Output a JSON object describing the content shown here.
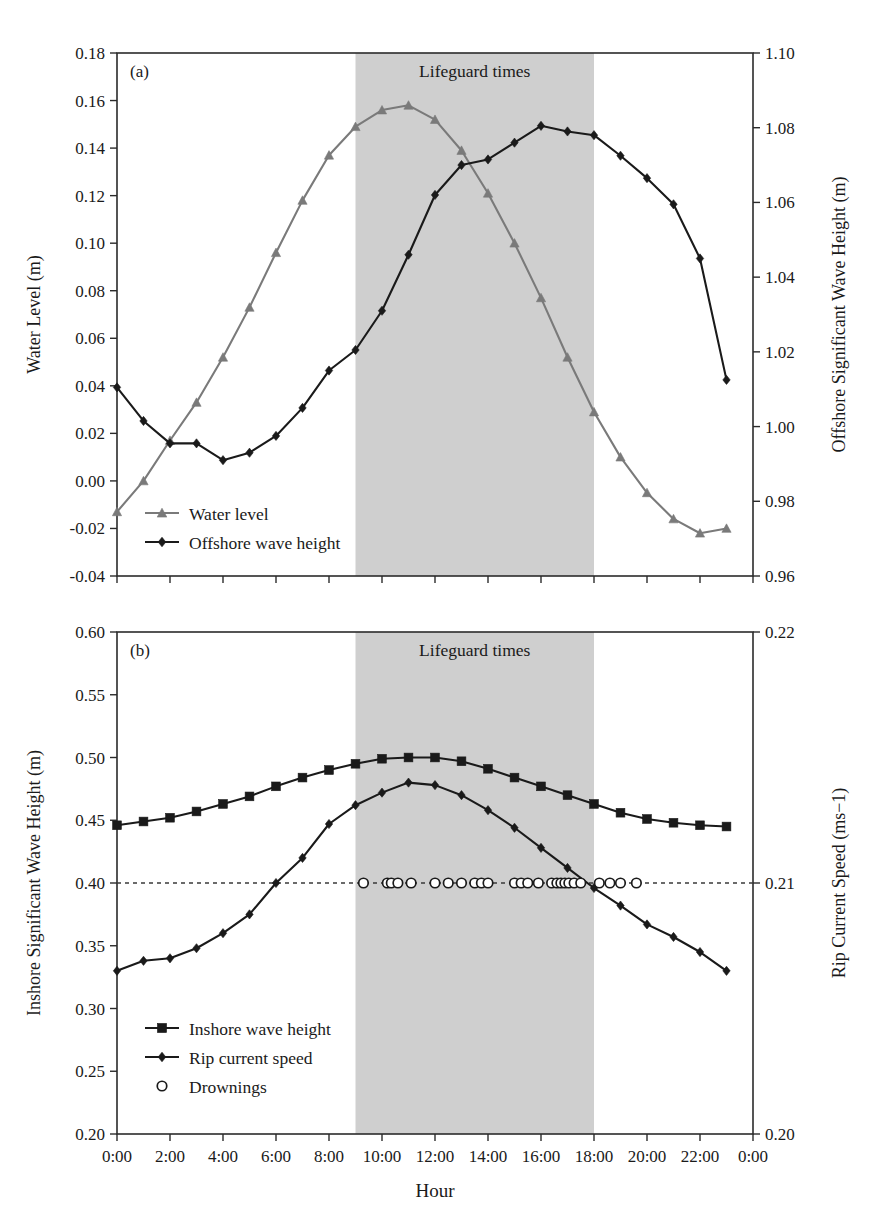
{
  "figure": {
    "width": 881,
    "height": 1224,
    "background": "#ffffff",
    "xlabel": "Hour",
    "band_label": "Lifeguard times",
    "panel_a_tag": "(a)",
    "panel_b_tag": "(b)"
  },
  "colors": {
    "water_level": "#7a7a7a",
    "offshore_wave": "#1a1a1a",
    "inshore_wave": "#1a1a1a",
    "rip_current": "#1a1a1a",
    "drownings": "#1a1a1a",
    "lifeguard_band": "#cfcfcf",
    "axis": "#2b2b2b",
    "dashed_line": "#3a3a3a"
  },
  "chart_data": [
    {
      "id": "panel_a",
      "type": "line",
      "title": "(a)",
      "xlabel": "Hour",
      "x": [
        "0:00",
        "1:00",
        "2:00",
        "3:00",
        "4:00",
        "5:00",
        "6:00",
        "7:00",
        "8:00",
        "9:00",
        "10:00",
        "11:00",
        "12:00",
        "13:00",
        "14:00",
        "15:00",
        "16:00",
        "17:00",
        "18:00",
        "19:00",
        "20:00",
        "21:00",
        "22:00",
        "23:00"
      ],
      "xticks": [
        "0:00",
        "2:00",
        "4:00",
        "6:00",
        "8:00",
        "10:00",
        "12:00",
        "14:00",
        "16:00",
        "18:00",
        "20:00",
        "22:00",
        "0:00"
      ],
      "xlim": [
        0,
        24
      ],
      "grid": false,
      "legend_position": "bottom-left",
      "left_axis": {
        "label": "Water Level (m)",
        "ylim": [
          -0.04,
          0.18
        ],
        "ticks": [
          -0.04,
          -0.02,
          0.0,
          0.02,
          0.04,
          0.06,
          0.08,
          0.1,
          0.12,
          0.14,
          0.16,
          0.18
        ],
        "ticklabels": [
          "-0.04",
          "-0.02",
          "0.00",
          "0.02",
          "0.04",
          "0.06",
          "0.08",
          "0.10",
          "0.12",
          "0.14",
          "0.16",
          "0.18"
        ]
      },
      "right_axis": {
        "label": "Offshore Significant Wave Height (m)",
        "ylim": [
          0.96,
          1.1
        ],
        "ticks": [
          0.96,
          0.98,
          1.0,
          1.02,
          1.04,
          1.06,
          1.08,
          1.1
        ],
        "ticklabels": [
          "0.96",
          "0.98",
          "1.00",
          "1.02",
          "1.04",
          "1.06",
          "1.08",
          "1.10"
        ]
      },
      "shaded_region": {
        "label": "Lifeguard times",
        "start": 9,
        "end": 18
      },
      "series": [
        {
          "name": "Water level",
          "axis": "left",
          "marker": "triangle",
          "color": "#7a7a7a",
          "values": [
            -0.013,
            0.0,
            0.017,
            0.033,
            0.052,
            0.073,
            0.096,
            0.118,
            0.137,
            0.149,
            0.156,
            0.158,
            0.152,
            0.139,
            0.121,
            0.1,
            0.077,
            0.052,
            0.029,
            0.01,
            -0.005,
            -0.016,
            -0.022,
            -0.02
          ]
        },
        {
          "name": "Offshore wave height",
          "axis": "right",
          "marker": "diamond",
          "color": "#1a1a1a",
          "values": [
            1.0105,
            1.0015,
            0.9955,
            0.9955,
            0.991,
            0.993,
            0.9975,
            1.005,
            1.015,
            1.0205,
            1.031,
            1.046,
            1.062,
            1.07,
            1.0715,
            1.076,
            1.0805,
            1.079,
            1.078,
            1.0725,
            1.0665,
            1.0595,
            1.045,
            1.0125
          ]
        }
      ]
    },
    {
      "id": "panel_b",
      "type": "line",
      "title": "(b)",
      "xlabel": "Hour",
      "x": [
        "0:00",
        "1:00",
        "2:00",
        "3:00",
        "4:00",
        "5:00",
        "6:00",
        "7:00",
        "8:00",
        "9:00",
        "10:00",
        "11:00",
        "12:00",
        "13:00",
        "14:00",
        "15:00",
        "16:00",
        "17:00",
        "18:00",
        "19:00",
        "20:00",
        "21:00",
        "22:00",
        "23:00"
      ],
      "xticks": [
        "0:00",
        "2:00",
        "4:00",
        "6:00",
        "8:00",
        "10:00",
        "12:00",
        "14:00",
        "16:00",
        "18:00",
        "20:00",
        "22:00",
        "0:00"
      ],
      "xlim": [
        0,
        24
      ],
      "grid": false,
      "legend_position": "bottom-left",
      "left_axis": {
        "label": "Inshore Significant Wave Height (m)",
        "ylim": [
          0.2,
          0.6
        ],
        "ticks": [
          0.2,
          0.25,
          0.3,
          0.35,
          0.4,
          0.45,
          0.5,
          0.55,
          0.6
        ],
        "ticklabels": [
          "0.20",
          "0.25",
          "0.30",
          "0.35",
          "0.40",
          "0.45",
          "0.50",
          "0.55",
          "0.60"
        ]
      },
      "right_axis": {
        "label": "Rip Current Speed (ms−1)",
        "ylim": [
          0.2,
          0.22
        ],
        "ticks": [
          0.2,
          0.21,
          0.22
        ],
        "ticklabels": [
          "0.20",
          "0.21",
          "0.22"
        ]
      },
      "shaded_region": {
        "label": "Lifeguard times",
        "start": 9,
        "end": 18
      },
      "reference_line": {
        "value": 0.4,
        "style": "dashed"
      },
      "series": [
        {
          "name": "Inshore wave height",
          "axis": "left",
          "marker": "square",
          "color": "#1a1a1a",
          "values": [
            0.446,
            0.449,
            0.452,
            0.457,
            0.463,
            0.469,
            0.477,
            0.484,
            0.49,
            0.495,
            0.499,
            0.5,
            0.5,
            0.497,
            0.491,
            0.484,
            0.477,
            0.47,
            0.463,
            0.456,
            0.451,
            0.448,
            0.446,
            0.445
          ]
        },
        {
          "name": "Rip current speed",
          "axis": "left_mapped",
          "marker": "diamond",
          "color": "#1a1a1a",
          "values": [
            0.33,
            0.338,
            0.34,
            0.348,
            0.36,
            0.375,
            0.4,
            0.42,
            0.447,
            0.462,
            0.472,
            0.48,
            0.478,
            0.47,
            0.458,
            0.444,
            0.428,
            0.412,
            0.396,
            0.382,
            0.367,
            0.357,
            0.345,
            0.33
          ]
        },
        {
          "name": "Drownings",
          "axis": "left",
          "marker": "open-circle",
          "color": "#1a1a1a",
          "level": 0.4,
          "times": [
            9.3,
            10.2,
            10.35,
            10.6,
            11.1,
            12.0,
            12.5,
            13.0,
            13.5,
            13.75,
            14.0,
            15.0,
            15.25,
            15.5,
            15.9,
            16.4,
            16.6,
            16.75,
            16.9,
            17.05,
            17.25,
            17.5,
            18.2,
            18.6,
            19.0,
            19.6
          ]
        }
      ]
    }
  ],
  "legends": {
    "panel_a": [
      {
        "label": "Water level",
        "marker": "triangle",
        "color": "#7a7a7a"
      },
      {
        "label": "Offshore wave height",
        "marker": "diamond",
        "color": "#1a1a1a"
      }
    ],
    "panel_b": [
      {
        "label": "Inshore wave height",
        "marker": "square",
        "color": "#1a1a1a"
      },
      {
        "label": "Rip current speed",
        "marker": "diamond",
        "color": "#1a1a1a"
      },
      {
        "label": "Drownings",
        "marker": "open-circle",
        "color": "#1a1a1a"
      }
    ]
  }
}
